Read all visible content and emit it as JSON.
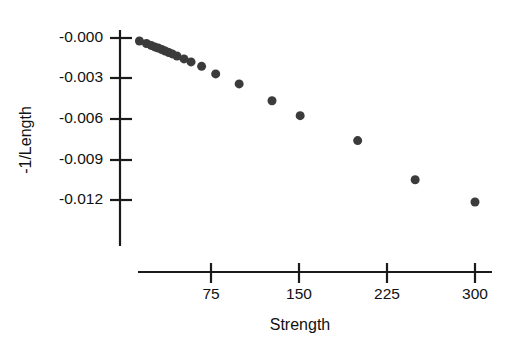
{
  "chart_data": {
    "type": "scatter",
    "title": "",
    "xlabel": "Strength",
    "ylabel": "-1/Length",
    "xlim": [
      0,
      312
    ],
    "ylim": [
      -0.0153,
      0.0005
    ],
    "grid": false,
    "legend": null,
    "xticks": [
      75,
      150,
      225,
      300
    ],
    "xtick_labels": [
      "75",
      "150",
      "225",
      "300"
    ],
    "yticks": [
      -0.0,
      -0.003,
      -0.006,
      -0.009,
      -0.012
    ],
    "ytick_labels": [
      "-0.000",
      "-0.003",
      "-0.006",
      "-0.009",
      "-0.012"
    ],
    "marker": {
      "shape": "circle",
      "color": "#3b3b3b",
      "size_px": 9
    },
    "points": [
      {
        "x": 14,
        "y": -0.00022
      },
      {
        "x": 20,
        "y": -0.00041
      },
      {
        "x": 24,
        "y": -0.00055
      },
      {
        "x": 27,
        "y": -0.00066
      },
      {
        "x": 30,
        "y": -0.00074
      },
      {
        "x": 33,
        "y": -0.00085
      },
      {
        "x": 36,
        "y": -0.00096
      },
      {
        "x": 39,
        "y": -0.00107
      },
      {
        "x": 42,
        "y": -0.00118
      },
      {
        "x": 46,
        "y": -0.00133
      },
      {
        "x": 52,
        "y": -0.00155
      },
      {
        "x": 58,
        "y": -0.00177
      },
      {
        "x": 67,
        "y": -0.0021
      },
      {
        "x": 79,
        "y": -0.00266
      },
      {
        "x": 99,
        "y": -0.0034
      },
      {
        "x": 127,
        "y": -0.00465
      },
      {
        "x": 151,
        "y": -0.00575
      },
      {
        "x": 200,
        "y": -0.0076
      },
      {
        "x": 249,
        "y": -0.0105
      },
      {
        "x": 300,
        "y": -0.01215
      }
    ]
  },
  "axes": {
    "y_axis_x_px": 120,
    "y_axis_top_px": 30,
    "y_axis_bottom_px": 246,
    "x_axis_y_px": 272,
    "x_axis_left_px": 138,
    "x_axis_right_px": 492,
    "y_tick_px": [
      38,
      78,
      119,
      160,
      200
    ],
    "x_tick_px": [
      211,
      299,
      387,
      475
    ]
  }
}
